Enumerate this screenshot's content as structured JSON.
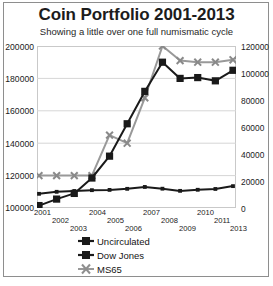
{
  "chart_data": {
    "type": "line",
    "title": "Coin Portfolio 2001-2013",
    "subtitle": "Showing a little over one full numismatic cycle",
    "xlabel": "",
    "ylabel": "",
    "grid": true,
    "legend_position": "bottom",
    "categories": [
      "2001",
      "2002",
      "2003",
      "2004",
      "2005",
      "2006",
      "2007",
      "2008",
      "2009",
      "2010",
      "2011",
      "2013"
    ],
    "x_tick_labels": [
      "2001",
      "2002",
      "2003",
      "2004",
      "2005",
      "2006",
      "2007",
      "2008",
      "2009",
      "2010",
      "2011",
      "2013"
    ],
    "left_axis": {
      "ylim": [
        100000,
        200000
      ],
      "ticks": [
        "100000",
        "120000",
        "140000",
        "160000",
        "180000",
        "200000"
      ],
      "tick_values": [
        100000,
        120000,
        140000,
        160000,
        180000,
        200000
      ]
    },
    "right_axis": {
      "ylim": [
        0,
        120000
      ],
      "ticks": [
        "0",
        "20000",
        "40000",
        "60000",
        "80000",
        "100000",
        "120000"
      ],
      "tick_values": [
        0,
        20000,
        40000,
        60000,
        80000,
        100000,
        120000
      ]
    },
    "series": [
      {
        "name": "Uncirculated",
        "axis": "right",
        "color": "#1a1a1a",
        "marker": "small-square",
        "values": [
          10500,
          12000,
          12600,
          13200,
          13400,
          14200,
          15600,
          14300,
          12700,
          13500,
          14100,
          16200
        ]
      },
      {
        "name": "Dow Jones",
        "axis": "left",
        "color": "#1a1a1a",
        "marker": "square",
        "values": [
          101500,
          105500,
          109000,
          118500,
          132000,
          152000,
          172000,
          190000,
          180000,
          180500,
          178500,
          185000
        ]
      },
      {
        "name": "MS65",
        "axis": "left",
        "color": "#999999",
        "marker": "x",
        "values": [
          120000,
          120000,
          120000,
          120000,
          145000,
          140000,
          168000,
          200000,
          191000,
          190000,
          190000,
          191500
        ]
      }
    ]
  },
  "legend": {
    "items": [
      {
        "label": "Uncirculated",
        "marker": "square-marker",
        "color": "#1a1a1a"
      },
      {
        "label": "Dow Jones",
        "marker": "square-marker",
        "color": "#1a1a1a"
      },
      {
        "label": "MS65",
        "marker": "x-marker",
        "color": "#999999"
      }
    ]
  }
}
